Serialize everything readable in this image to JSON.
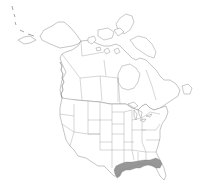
{
  "map": {
    "title": "Range map - North America",
    "region": "North America",
    "background_color": "#ffffff",
    "outline_color": "#8a8a8a",
    "range_color": "#8c8c8c",
    "range": {
      "label": "Species distribution range",
      "areas": [
        "Texas Gulf Coast",
        "Louisiana",
        "Mississippi",
        "Alabama",
        "Georgia (south)",
        "Florida panhandle and north Florida",
        "South Carolina (coastal)"
      ]
    }
  }
}
